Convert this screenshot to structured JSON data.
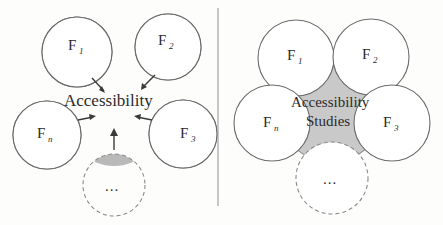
{
  "figure": {
    "panels": [
      {
        "id": "left",
        "name": "contributing-fields-converging",
        "center_label": "Accessibility",
        "ellipsis": "...",
        "fields": [
          {
            "key": "f1",
            "base": "F",
            "sub": "1",
            "position": "top-left"
          },
          {
            "key": "f2",
            "base": "F",
            "sub": "2",
            "position": "top-right"
          },
          {
            "key": "f3",
            "base": "F",
            "sub": "3",
            "position": "bottom-right"
          },
          {
            "key": "fn",
            "base": "F",
            "sub": "n",
            "position": "bottom-left"
          },
          {
            "key": "fmore",
            "base": "",
            "sub": "",
            "position": "bottom-center"
          }
        ],
        "arrow_count": 5
      },
      {
        "id": "right",
        "name": "accessibility-studies-overlap",
        "center_label_line1": "Accessibility",
        "center_label_line2": "Studies",
        "ellipsis": "...",
        "fields": [
          {
            "key": "f1",
            "base": "F",
            "sub": "1",
            "position": "top-left"
          },
          {
            "key": "f2",
            "base": "F",
            "sub": "2",
            "position": "top-right"
          },
          {
            "key": "f3",
            "base": "F",
            "sub": "3",
            "position": "bottom-right"
          },
          {
            "key": "fn",
            "base": "F",
            "sub": "n",
            "position": "bottom-left"
          },
          {
            "key": "fmore",
            "base": "",
            "sub": "",
            "position": "bottom-center"
          }
        ]
      }
    ],
    "colors": {
      "circle_stroke": "#6b6b6b",
      "dashed_stroke": "#8a8a8a",
      "segment_dark": "#8e8e8e",
      "segment_light": "#b9b9b9",
      "center_fill": "#c9c9c9",
      "lens_overlap": "#8f8f8f",
      "arrow": "#3a3a3a",
      "divider": "#9a9a9a",
      "text": "#2b2b2b",
      "background": "#fdfdfc"
    }
  }
}
